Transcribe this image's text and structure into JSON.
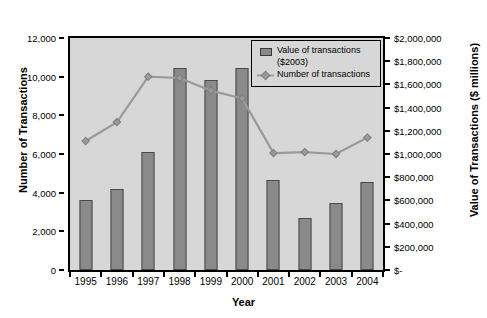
{
  "chart_data": {
    "type": "bar",
    "title": "",
    "xlabel": "Year",
    "ylabel": "Number of Transactions",
    "y2label": "Value of Transactions ($ millions)",
    "categories": [
      "1995",
      "1996",
      "1997",
      "1998",
      "1999",
      "2000",
      "2001",
      "2002",
      "2003",
      "2004"
    ],
    "grid": false,
    "legend_position": "top-right",
    "ylim": [
      0,
      12000
    ],
    "y2lim": [
      0,
      2000000
    ],
    "yticks": [
      "0",
      "2,000",
      "4,000",
      "6,000",
      "8,000",
      "10,000",
      "12,000"
    ],
    "ytick_values": [
      0,
      2000,
      4000,
      6000,
      8000,
      10000,
      12000
    ],
    "y2ticks": [
      "$-",
      "$200,000",
      "$400,000",
      "$600,000",
      "$800,000",
      "$1,000,000",
      "$1,200,000",
      "$1,400,000",
      "$1,600,000",
      "$1,800,000",
      "$2,000,000"
    ],
    "y2tick_values": [
      0,
      200000,
      400000,
      600000,
      800000,
      1000000,
      1200000,
      1400000,
      1600000,
      1800000,
      2000000
    ],
    "series": [
      {
        "name": "Value of transactions ($2003)",
        "type": "bar",
        "axis": "right",
        "unit": "$ millions",
        "color": "#8a8a8a",
        "values": [
          600000,
          695000,
          1015000,
          1745000,
          1635000,
          1745000,
          780000,
          450000,
          575000,
          760000
        ]
      },
      {
        "name": "Number of transactions",
        "type": "line",
        "axis": "left",
        "color": "#9a9a9a",
        "values": [
          6670,
          7650,
          10000,
          9930,
          9280,
          8870,
          6050,
          6100,
          6000,
          6850
        ]
      }
    ]
  },
  "legend": {
    "entry1_line1": "Value of transactions",
    "entry1_line2": "($2003)",
    "entry2": "Number of transactions"
  },
  "colors": {
    "bar_fill": "#8a8a8a",
    "bar_stroke": "#4a4a4a",
    "line": "#9a9a9a",
    "plot_background": "#d7d7d7",
    "axis": "#000000",
    "page_background": "#ffffff"
  }
}
